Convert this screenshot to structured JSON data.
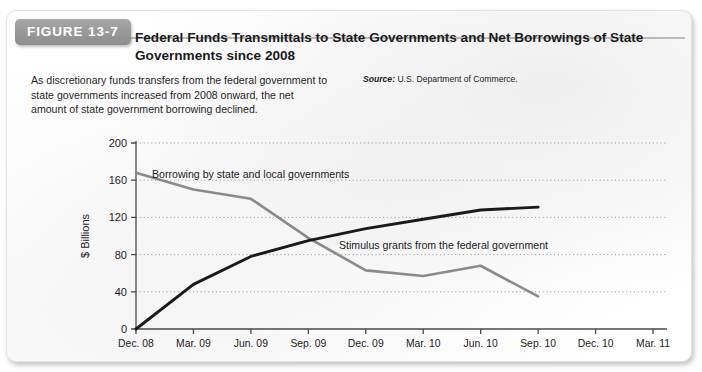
{
  "figure": {
    "badge_label": "FIGURE 13-7",
    "title": "Federal Funds Transmittals to State Governments and Net Borrowings of State Governments since 2008",
    "caption": "As discretionary funds transfers from the federal government to state governments increased from 2008 onward, the net amount of state government borrowing declined.",
    "source_word": "Source:",
    "source_text": "U.S. Department of Commerce."
  },
  "chart_data": {
    "type": "line",
    "title": "Federal Funds Transmittals to State Governments and Net Borrowings of State Governments since 2008",
    "xlabel": "",
    "ylabel": "$ Billions",
    "categories": [
      "Dec. 08",
      "Mar. 09",
      "Jun. 09",
      "Sep. 09",
      "Dec. 09",
      "Mar. 10",
      "Jun. 10",
      "Sep. 10",
      "Dec. 10",
      "Mar. 11"
    ],
    "yticks": [
      0,
      40,
      80,
      120,
      160,
      200
    ],
    "ylim": [
      0,
      200
    ],
    "grid": true,
    "legend_position": "inline-annotations",
    "series": [
      {
        "name": "Borrowing by state and local governments",
        "color": "#8a8a8a",
        "annotation": "Borrowing by state and local governments",
        "x": [
          "Dec. 08",
          "Mar. 09",
          "Jun. 09",
          "Sep. 09",
          "Dec. 09",
          "Mar. 10",
          "Jun. 10",
          "Sep. 10"
        ],
        "values": [
          168,
          150,
          140,
          98,
          63,
          57,
          68,
          35
        ]
      },
      {
        "name": "Stimulus grants from the federal government",
        "color": "#1a1a1a",
        "annotation": "Stimulus grants from the federal government",
        "x": [
          "Dec. 08",
          "Mar. 09",
          "Jun. 09",
          "Sep. 09",
          "Dec. 09",
          "Mar. 10",
          "Jun. 10",
          "Sep. 10"
        ],
        "values": [
          0,
          48,
          78,
          95,
          108,
          118,
          128,
          131
        ]
      }
    ]
  },
  "colors": {
    "badge_background": "#9a9a9a",
    "badge_text": "#ffffff",
    "borrowing_line": "#8a8a8a",
    "stimulus_line": "#1a1a1a",
    "axis": "#4a4a4a",
    "gridline": "#9d9d9d"
  }
}
